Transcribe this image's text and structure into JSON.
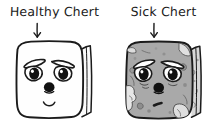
{
  "figure": {
    "title_text_left": "Healthy Chert",
    "title_text_right": "Sick Chert",
    "background_color": "#ffffff",
    "ink_color": "#1b1b1b"
  },
  "panels": [
    {
      "id": "healthy",
      "label": "Healthy Chert",
      "arrow_icon": "down-arrow-icon",
      "cube_icon": "chert-cube-healthy-icon",
      "face": {
        "expression": "content-smile",
        "eyes": "heavy-lidded-eyes",
        "brows": "angled-brows",
        "nose": "round-nose",
        "mouth": "small-smile"
      },
      "colors": {
        "front_face": "#fefefe",
        "side_face": "#fbfbfb",
        "outline": "#1b1b1b",
        "feature": "#111111"
      },
      "texture": "smooth"
    },
    {
      "id": "sick",
      "label": "Sick Chert",
      "arrow_icon": "down-arrow-icon",
      "cube_icon": "chert-cube-sick-icon",
      "face": {
        "expression": "unwell-frown",
        "eyes": "heavy-lidded-eyes",
        "brows": "angled-brows",
        "nose": "round-nose",
        "mouth": "small-dash-frown"
      },
      "colors": {
        "front_face": "#a9a9a9",
        "side_face": "#d8d8d8",
        "outline": "#1b1b1b",
        "feature": "#111111",
        "blotch_light": "#e8e8e8",
        "blotch_dark": "#8d8d8d"
      },
      "texture": "mottled-weathered"
    }
  ]
}
